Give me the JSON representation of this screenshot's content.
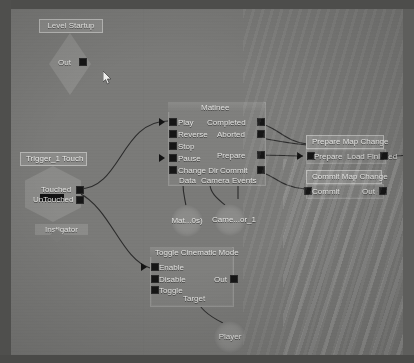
{
  "app": {
    "editor": "Kismet Sequence Editor",
    "background_color": "#7a7a78",
    "node_color": "#7f7f7d",
    "title_color": "#8b8b89",
    "pin_color": "#151515",
    "wire_color": "#2b2b2b",
    "text_color": "#e2e2e0"
  },
  "nodes": {
    "level_startup": {
      "title": "Level Startup",
      "out_label": "Out"
    },
    "trigger_touch": {
      "title": "Trigger_1 Touch",
      "out_touched": "Touched",
      "out_untouched": "UnTouched",
      "var_instigator": "Instigator"
    },
    "matinee": {
      "title": "Matinee",
      "inputs": [
        "Play",
        "Reverse",
        "Stop",
        "Pause",
        "Change Dir"
      ],
      "outputs": [
        "Completed",
        "Aborted",
        "Prepare",
        "Commit",
        "Events"
      ],
      "var_data": "Data",
      "var_camera": "Camera",
      "var_events": "Events"
    },
    "prepare_map_change": {
      "title": "Prepare Map Change",
      "input": "Prepare",
      "output": "Load Finished"
    },
    "commit_map_change": {
      "title": "Commit Map Change",
      "input": "Commit",
      "output": "Out"
    },
    "toggle_cinematic_mode": {
      "title": "Toggle Cinematic Mode",
      "inputs": [
        "Enable",
        "Disable",
        "Toggle"
      ],
      "output": "Out",
      "var_target": "Target"
    },
    "var_matinee_data": {
      "label": "Mat...0s)"
    },
    "var_camera_actor": {
      "label": "Came...or_1"
    },
    "var_player": {
      "label": "Player"
    }
  }
}
